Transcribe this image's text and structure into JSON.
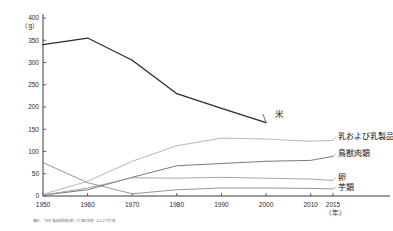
{
  "chart_data": {
    "type": "line",
    "title": "",
    "xlabel": "年",
    "ylabel": "",
    "unit_label": "（g）",
    "year_suffix": "（年）",
    "grid": false,
    "legend": "inline-right",
    "x": [
      1950,
      1960,
      1970,
      1980,
      1990,
      2000,
      2010,
      2015
    ],
    "xtick_labels": [
      "1950",
      "1960",
      "1970",
      "1980",
      "1990",
      "2000",
      "2010",
      "2015"
    ],
    "ytick_labels": [
      "0",
      "50",
      "100",
      "150",
      "200",
      "250",
      "300",
      "350",
      "400"
    ],
    "ylim": [
      0,
      400
    ],
    "ytick_step": 50,
    "series": [
      {
        "name": "米",
        "color": "#2b2b2b",
        "width": 1.3,
        "values": [
          340,
          355,
          305,
          230,
          197,
          165,
          null,
          null
        ],
        "label_x": 2002,
        "label_y": 178
      },
      {
        "name": "乳および乳製品",
        "color": "#b8b8b8",
        "width": 1.0,
        "values": [
          4,
          33,
          78,
          113,
          130,
          128,
          123,
          125
        ],
        "label_x": 2016,
        "label_y": 128
      },
      {
        "name": "鳥獣肉類",
        "color": "#7a7a7a",
        "width": 1.0,
        "values": [
          2,
          14,
          42,
          68,
          73,
          78,
          80,
          89
        ],
        "label_x": 2016,
        "label_y": 89
      },
      {
        "name": "卵",
        "color": "#9a9a9a",
        "width": 0.9,
        "values": [
          2,
          18,
          41,
          40,
          42,
          40,
          38,
          35
        ],
        "label_x": 2016,
        "label_y": 36
      },
      {
        "name": "芋類",
        "color": "#8a8a8a",
        "width": 0.9,
        "values": [
          75,
          30,
          5,
          14,
          18,
          18,
          17,
          16
        ],
        "label_x": 2016,
        "label_y": 14
      }
    ]
  },
  "footer": {
    "note": "資料：「日本食品標準成分表」（文部科学省）などより作成"
  }
}
